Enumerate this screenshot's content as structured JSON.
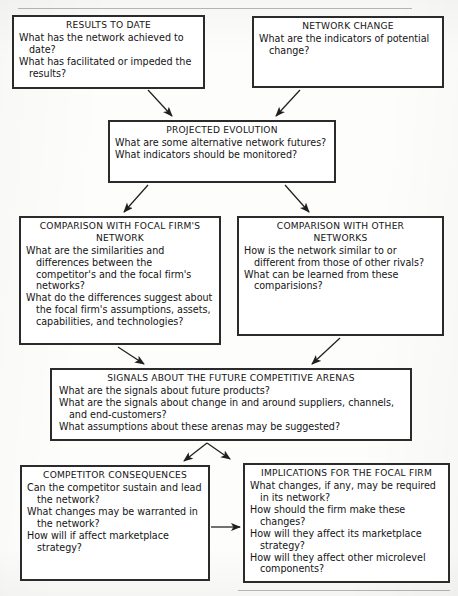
{
  "page": {
    "width": 458,
    "height": 596,
    "ink_color": "#2b2b2b",
    "paper_color": "#fdfdfc"
  },
  "diagram": {
    "type": "flowchart",
    "boxes": [
      {
        "id": "results-to-date",
        "title": "RESULTS TO DATE",
        "questions": [
          "What has the network achieved to date?",
          "What has facilitated or impeded the results?"
        ]
      },
      {
        "id": "network-change",
        "title": "NETWORK CHANGE",
        "questions": [
          "What are the indicators of potential change?"
        ]
      },
      {
        "id": "projected-evolution",
        "title": "PROJECTED EVOLUTION",
        "questions": [
          "What are some alternative network futures?",
          "What indicators should be monitored?"
        ]
      },
      {
        "id": "comparison-with-focal-firms-network",
        "title": "COMPARISON WITH FOCAL FIRM'S\nNETWORK",
        "questions": [
          "What are the similarities and differences between the competitor's and the focal firm's networks?",
          "What do the differences suggest about the focal firm's assumptions, assets, capabilities, and technologies?"
        ]
      },
      {
        "id": "comparison-with-other-networks",
        "title": "COMPARISON WITH OTHER\nNETWORKS",
        "questions": [
          "How is the network similar to or different from those of other rivals?",
          "What can be learned from these comparisions?"
        ]
      },
      {
        "id": "signals-about-the-future-competitive-arenas",
        "title": "SIGNALS ABOUT THE FUTURE COMPETITIVE ARENAS",
        "questions": [
          "What are the signals about future products?",
          "What are the signals about change in and around suppliers, channels, and end-customers?",
          "What assumptions about these arenas may be suggested?"
        ]
      },
      {
        "id": "competitor-consequences",
        "title": "COMPETITOR CONSEQUENCES",
        "questions": [
          "Can the competitor sustain and lead the network?",
          "What changes may be warranted in the network?",
          "How will if affect marketplace strategy?"
        ]
      },
      {
        "id": "implications-for-the-focal-firm",
        "title": "IMPLICATIONS FOR THE FOCAL FIRM",
        "questions": [
          "What changes, if any, may be required in its network?",
          "How should the firm make these changes?",
          "How will they affect its marketplace strategy?",
          "How will they affect other microlevel components?"
        ]
      }
    ],
    "connectors": [
      {
        "from": "results-to-date",
        "to": "projected-evolution"
      },
      {
        "from": "network-change",
        "to": "projected-evolution"
      },
      {
        "from": "projected-evolution",
        "to": "comparison-with-focal-firms-network"
      },
      {
        "from": "projected-evolution",
        "to": "comparison-with-other-networks"
      },
      {
        "from": "comparison-with-focal-firms-network",
        "to": "signals-about-the-future-competitive-arenas"
      },
      {
        "from": "comparison-with-other-networks",
        "to": "signals-about-the-future-competitive-arenas"
      },
      {
        "from": "signals-about-the-future-competitive-arenas",
        "to": "competitor-consequences"
      },
      {
        "from": "signals-about-the-future-competitive-arenas",
        "to": "implications-for-the-focal-firm"
      },
      {
        "from": "competitor-consequences",
        "to": "implications-for-the-focal-firm"
      }
    ]
  }
}
